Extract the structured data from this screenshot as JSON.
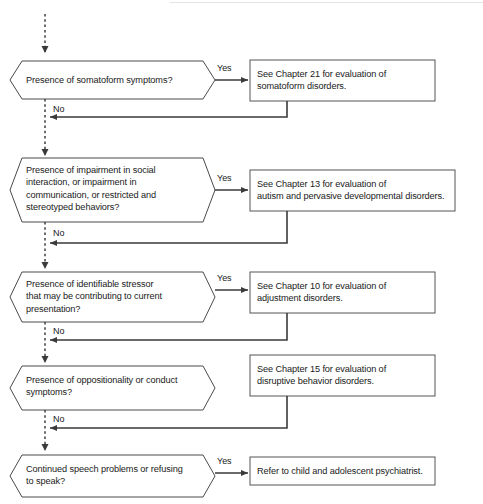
{
  "diagram": {
    "type": "flowchart",
    "colors": {
      "stroke": "#3a3a3a",
      "text": "#1a1a1a",
      "background": "#ffffff",
      "dashed_stroke": "#555555"
    },
    "entry": {
      "label": "",
      "style": "dashed-arrow-down"
    },
    "steps": [
      {
        "id": "step1",
        "decision": "Presence of somatoform symptoms?",
        "yes_label": "Yes",
        "no_label": "No",
        "action": "See Chapter 21 for evaluation of\nsomatoform disorders."
      },
      {
        "id": "step2",
        "decision": "Presence of impairment in social\ninteraction, or impairment in\ncommunication, or restricted and\nstereotyped behaviors?",
        "yes_label": "Yes",
        "no_label": "No",
        "action": "See Chapter 13 for evaluation of\nautism and pervasive developmental disorders."
      },
      {
        "id": "step3",
        "decision": "Presence of identifiable stressor\nthat may be contributing to current\npresentation?",
        "yes_label": "Yes",
        "no_label": "No",
        "action": "See Chapter 10 for evaluation of\nadjustment disorders."
      },
      {
        "id": "step4",
        "decision": "Presence of oppositionality or conduct\nsymptoms?",
        "yes_label": "",
        "no_label": "No",
        "action": "See Chapter 15 for evaluation of\ndisruptive behavior disorders."
      },
      {
        "id": "step5",
        "decision": "Continued speech problems or refusing\nto speak?",
        "yes_label": "Yes",
        "no_label": "",
        "action": "Refer to child and adolescent psychiatrist."
      }
    ]
  }
}
